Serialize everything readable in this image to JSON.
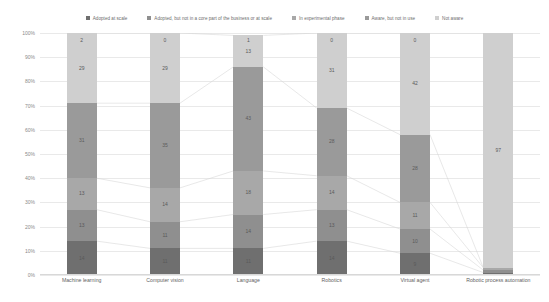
{
  "legend": {
    "items": [
      {
        "label": "Adopted at scale",
        "color": "#6f6f6f"
      },
      {
        "label": "Adopted, but not in a core part of the business or at scale",
        "color": "#8f8f8f"
      },
      {
        "label": "In experimental phase",
        "color": "#a8a8a8"
      },
      {
        "label": "Aware, but not in use",
        "color": "#9a9a9a"
      },
      {
        "label": "Not aware",
        "color": "#cfcfcf"
      }
    ]
  },
  "yaxis": {
    "ticks": [
      "100%",
      "90%",
      "80%",
      "70%",
      "60%",
      "50%",
      "40%",
      "30%",
      "20%",
      "10%",
      "0%"
    ],
    "min": 0,
    "max": 100
  },
  "chart_data": {
    "type": "bar",
    "subtype": "stacked-percent",
    "title": "",
    "xlabel": "",
    "ylabel": "",
    "ylim": [
      0,
      100
    ],
    "grid": true,
    "legend_position": "top",
    "categories": [
      "Machine learning",
      "Computer vision",
      "Language",
      "Robotics",
      "Virtual agent",
      "Robotic process automation"
    ],
    "series": [
      {
        "name": "Adopted at scale",
        "color": "#6f6f6f",
        "values": [
          14,
          11,
          11,
          14,
          9,
          1
        ]
      },
      {
        "name": "Adopted, but not in a core part of the business or at scale",
        "color": "#8f8f8f",
        "values": [
          13,
          11,
          14,
          13,
          10,
          1
        ]
      },
      {
        "name": "In experimental phase",
        "color": "#a8a8a8",
        "values": [
          13,
          14,
          18,
          14,
          11,
          1
        ]
      },
      {
        "name": "Aware, but not in use",
        "color": "#9a9a9a",
        "values": [
          31,
          35,
          43,
          28,
          28,
          0
        ]
      },
      {
        "name": "Not aware",
        "color": "#cfcfcf",
        "values": [
          29,
          29,
          13,
          31,
          42,
          97
        ]
      }
    ],
    "data_labels": {
      "Machine learning": {
        "adopted_at_scale": "14",
        "adopted_not_core": "13",
        "experimental": "13",
        "aware_not_used": "31",
        "not_aware": "29",
        "top": "2"
      },
      "Computer vision": {
        "adopted_at_scale": "11",
        "adopted_not_core": "11",
        "experimental": "14",
        "aware_not_used": "35",
        "not_aware": "29",
        "top": "0"
      },
      "Language": {
        "adopted_at_scale": "11",
        "adopted_not_core": "14",
        "experimental": "18",
        "aware_not_used": "43",
        "not_aware": "13",
        "top": "1"
      },
      "Robotics": {
        "adopted_at_scale": "14",
        "adopted_not_core": "13",
        "experimental": "14",
        "aware_not_used": "28",
        "not_aware": "31",
        "top": "0"
      },
      "Virtual agent": {
        "adopted_at_scale": "9",
        "adopted_not_core": "10",
        "experimental": "11",
        "aware_not_used": "28",
        "not_aware": "42",
        "top": "0"
      },
      "Robotic process automation": {
        "adopted_at_scale": "1",
        "adopted_not_core": "1",
        "experimental": "1",
        "aware_not_used": "0",
        "not_aware": "97",
        "top": ""
      }
    }
  }
}
